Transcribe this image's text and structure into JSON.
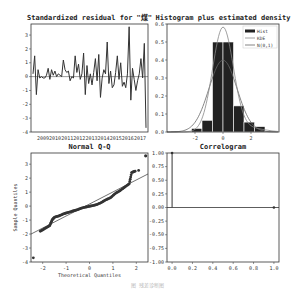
{
  "figure": {
    "caption": "图 残差诊断图"
  },
  "chart_data": [
    {
      "type": "line",
      "title": "Standardized residual for \"煤\"",
      "xlabel": "",
      "ylabel": "",
      "x_ticks": [
        "2009",
        "2010",
        "2011",
        "2012",
        "2013",
        "2014",
        "2015",
        "2016",
        "2017"
      ],
      "y_ticks": [
        "-4",
        "-3",
        "-2",
        "-1",
        "0",
        "1",
        "2",
        "3"
      ],
      "ylim": [
        -4,
        3.8
      ],
      "values": [
        0.2,
        1.5,
        -1.3,
        0.5,
        -0.1,
        0,
        -0.1,
        -0.1,
        0.1,
        0.6,
        -0.2,
        0.5,
        0.1,
        0.4,
        0,
        0.2,
        0.1,
        0,
        1.2,
        0.5,
        0.3,
        0.4,
        -0.3,
        0,
        -0.1,
        1.5,
        0.3,
        0.9,
        -0.2,
        0.2,
        1.7,
        -1.3,
        0.8,
        -0.5,
        0.2,
        -0.6,
        0.3,
        1.3,
        -0.3,
        1.6,
        -1.5,
        -0.1,
        0.5,
        0.2,
        2.5,
        -0.5,
        0.4,
        -0.8,
        -0.6,
        0.3,
        1.5,
        -0.2,
        1,
        -0.7,
        -0.4,
        -0.8,
        0.2,
        3.6,
        -1.7,
        0.6,
        -0.2,
        -1,
        -0.3,
        0.2,
        1.3,
        -0.1,
        2.4,
        -3.7
      ],
      "hline": 0
    },
    {
      "type": "bar",
      "title": "Histogram plus estimated density",
      "xlabel": "",
      "ylabel": "",
      "x_ticks": [
        "-2",
        "0",
        "2"
      ],
      "y_ticks": [
        "0.0",
        "0.1",
        "0.2",
        "0.3",
        "0.4",
        "0.5",
        "0.6"
      ],
      "xlim": [
        -4,
        4
      ],
      "ylim": [
        0,
        0.6
      ],
      "bins": [
        -3.75,
        -3,
        -2.25,
        -1.5,
        -0.75,
        0,
        0.75,
        1.5,
        2.25,
        3,
        3.75
      ],
      "values": [
        0.005,
        0.0,
        0.02,
        0.065,
        0.5,
        0.5,
        0.145,
        0.055,
        0.03,
        0.005
      ],
      "legend": [
        "Hist",
        "KDE",
        "N(0,1)"
      ],
      "legend_position": "upper right"
    },
    {
      "type": "scatter",
      "title": "Normal Q-Q",
      "xlabel": "Theoretical Quantiles",
      "ylabel": "Sample Quantiles",
      "x_ticks": [
        "-2",
        "-1",
        "0",
        "1",
        "2"
      ],
      "y_ticks": [
        "-4",
        "-3",
        "-2",
        "-1",
        "0",
        "1",
        "2",
        "3"
      ],
      "xlim": [
        -2.5,
        2.5
      ],
      "ylim": [
        -4,
        3.8
      ],
      "points": [
        [
          -2.4,
          -3.7
        ],
        [
          -2.1,
          -1.8
        ],
        [
          -1.9,
          -1.6
        ],
        [
          -1.7,
          -1.4
        ],
        [
          -1.6,
          -1.0
        ],
        [
          -1.5,
          -0.8
        ],
        [
          -1.3,
          -0.7
        ],
        [
          -1.1,
          -0.55
        ],
        [
          -0.9,
          -0.45
        ],
        [
          -0.7,
          -0.35
        ],
        [
          -0.5,
          -0.25
        ],
        [
          -0.3,
          -0.12
        ],
        [
          -0.1,
          -0.05
        ],
        [
          0.1,
          0.02
        ],
        [
          0.3,
          0.1
        ],
        [
          0.5,
          0.25
        ],
        [
          0.7,
          0.45
        ],
        [
          0.9,
          0.6
        ],
        [
          1.1,
          0.9
        ],
        [
          1.3,
          1.1
        ],
        [
          1.5,
          1.35
        ],
        [
          1.7,
          1.6
        ],
        [
          1.8,
          2.4
        ],
        [
          1.95,
          2.5
        ],
        [
          2.1,
          2.55
        ],
        [
          2.4,
          3.6
        ]
      ],
      "reference_line": [
        [
          -2.5,
          -2.0
        ],
        [
          2.5,
          2.3
        ]
      ]
    },
    {
      "type": "bar",
      "title": "Correlogram",
      "xlabel": "",
      "ylabel": "",
      "x_ticks": [
        "0.0",
        "0.2",
        "0.4",
        "0.6",
        "0.8",
        "1.0"
      ],
      "y_ticks": [
        "-1.00",
        "-0.75",
        "-0.50",
        "-0.25",
        "0.00",
        "0.25",
        "0.50",
        "0.75",
        "1.00"
      ],
      "xlim": [
        -0.05,
        1.05
      ],
      "ylim": [
        -1,
        1
      ],
      "lags": [
        0,
        1
      ],
      "values": [
        1.0,
        0.0
      ]
    }
  ]
}
